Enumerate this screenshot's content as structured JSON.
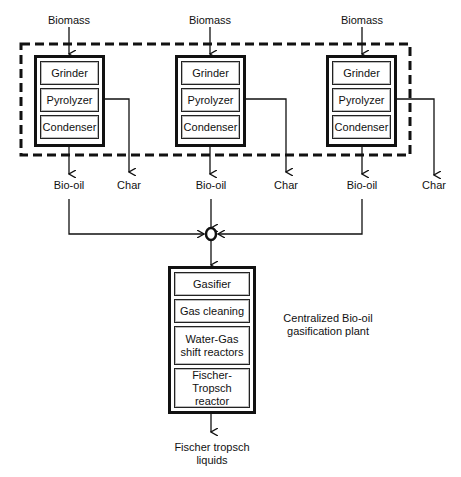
{
  "diagram": {
    "units": [
      {
        "input": "Biomass",
        "steps": [
          "Grinder",
          "Pyrolyzer",
          "Condenser"
        ],
        "outputs": [
          "Bio-oil",
          "Char"
        ]
      },
      {
        "input": "Biomass",
        "steps": [
          "Grinder",
          "Pyrolyzer",
          "Condenser"
        ],
        "outputs": [
          "Bio-oil",
          "Char"
        ]
      },
      {
        "input": "Biomass",
        "steps": [
          "Grinder",
          "Pyrolyzer",
          "Condenser"
        ],
        "outputs": [
          "Bio-oil",
          "Char"
        ]
      }
    ],
    "central_plant": {
      "label": "Centralized Bio-oil gasification plant",
      "steps": [
        "Gasifier",
        "Gas cleaning",
        "Water-Gas shift reactors",
        "Fischer-Tropsch reactor"
      ],
      "output": "Fischer tropsch liquids"
    },
    "colors": {
      "line": "#111111",
      "background": "#ffffff"
    }
  }
}
